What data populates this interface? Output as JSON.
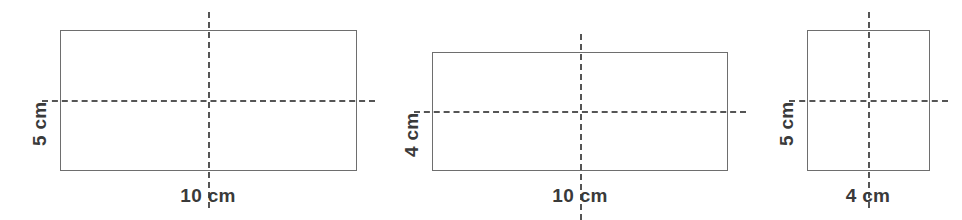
{
  "page": {
    "background_color": "#ffffff",
    "stroke_color": "#6e6e6e",
    "dash_color": "#555555",
    "label_color": "#3a3a3a"
  },
  "figures": [
    {
      "id": "figure-1",
      "width_label": "10 cm",
      "height_label": "5 cm",
      "width_cm": 10,
      "height_cm": 5,
      "rect": {
        "x": 60,
        "y": 30,
        "w": 297,
        "h": 141
      },
      "center": {
        "x": 208,
        "y": 100
      },
      "dash_v": {
        "x": 208,
        "y": 12,
        "h": 196
      },
      "dash_h": {
        "x": 42,
        "y": 100,
        "w": 333
      },
      "width_label_pos": {
        "x": 208,
        "y": 186
      },
      "height_label_pos": {
        "x": 30,
        "y": 146
      }
    },
    {
      "id": "figure-2",
      "width_label": "10 cm",
      "height_label": "4 cm",
      "width_cm": 10,
      "height_cm": 4,
      "rect": {
        "x": 432,
        "y": 52,
        "w": 296,
        "h": 119
      },
      "center": {
        "x": 580,
        "y": 111
      },
      "dash_v": {
        "x": 580,
        "y": 34,
        "h": 186
      },
      "dash_h": {
        "x": 414,
        "y": 111,
        "w": 332
      },
      "width_label_pos": {
        "x": 580,
        "y": 186
      },
      "height_label_pos": {
        "x": 402,
        "y": 157
      }
    },
    {
      "id": "figure-3",
      "width_label": "4 cm",
      "height_label": "5 cm",
      "width_cm": 4,
      "height_cm": 5,
      "rect": {
        "x": 807,
        "y": 30,
        "w": 123,
        "h": 141
      },
      "center": {
        "x": 868,
        "y": 100
      },
      "dash_v": {
        "x": 868,
        "y": 12,
        "h": 196
      },
      "dash_h": {
        "x": 789,
        "y": 100,
        "w": 159
      },
      "width_label_pos": {
        "x": 868,
        "y": 186
      },
      "height_label_pos": {
        "x": 777,
        "y": 146
      }
    }
  ]
}
